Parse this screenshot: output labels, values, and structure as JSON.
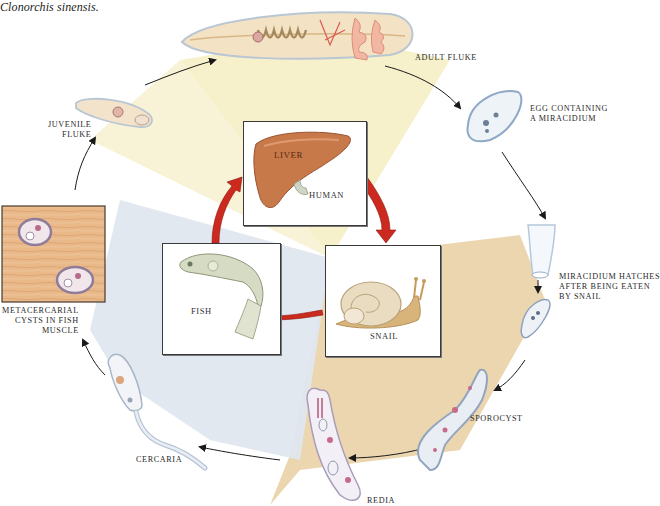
{
  "caption": "Clonorchis sinensis.",
  "hosts": {
    "human": {
      "label": "HUMAN",
      "organ_label": "LIVER"
    },
    "snail": {
      "label": "SNAIL"
    },
    "fish": {
      "label": "FISH"
    }
  },
  "stages": [
    {
      "id": "adult-fluke",
      "label": "ADULT FLUKE"
    },
    {
      "id": "egg",
      "label_line1": "EGG CONTAINING",
      "label_line2": "A MIRACIDIUM"
    },
    {
      "id": "miracidium",
      "label_line1": "MIRACIDIUM HATCHES",
      "label_line2": "AFTER BEING EATEN",
      "label_line3": "BY SNAIL"
    },
    {
      "id": "sporocyst",
      "label": "SPOROCYST"
    },
    {
      "id": "redia",
      "label": "REDIA"
    },
    {
      "id": "cercaria",
      "label": "CERCARIA"
    },
    {
      "id": "metacercarial-cysts",
      "label_line1": "METACERCARIAL",
      "label_line2": "CYSTS IN FISH",
      "label_line3": "MUSCLE"
    },
    {
      "id": "juvenile-fluke",
      "label_line1": "JUVENILE",
      "label_line2": "FLUKE"
    }
  ],
  "colors": {
    "human_sector": "#f6f0c8",
    "snail_sector": "#ecd6b0",
    "fish_sector": "#dde6ee",
    "host_arrow": "#cc2a1e",
    "cycle_arrow": "#1a1a1a",
    "liver": "#c7794a",
    "fish_muscle": "#e8b888"
  }
}
